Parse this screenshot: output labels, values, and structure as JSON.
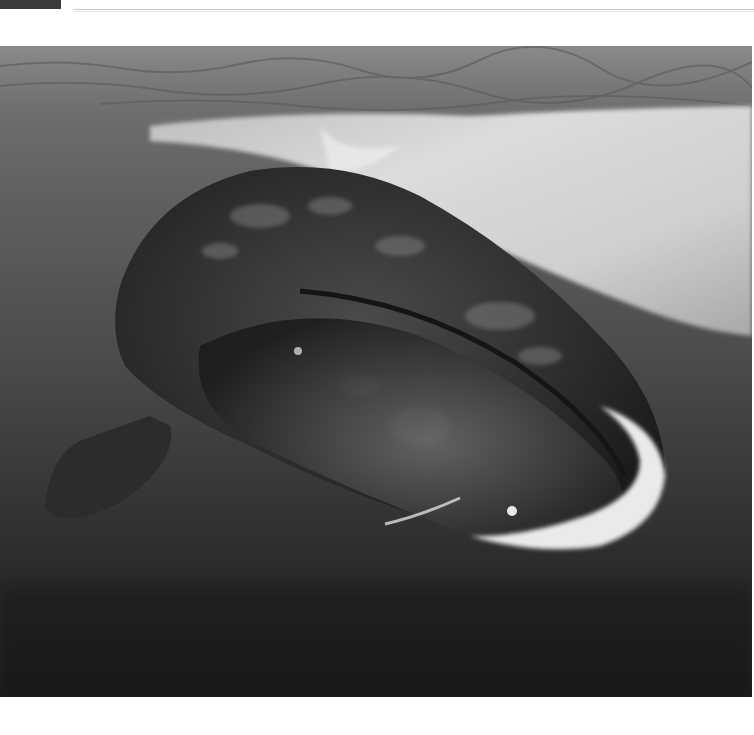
{
  "page": {
    "header": {
      "caption_fragment": "",
      "has_rule": true
    },
    "photo": {
      "subject": "bowhead whale underwater",
      "alt": "Bowhead whale swimming beneath sea ice, black and white photograph",
      "tone": "grayscale",
      "colors": {
        "water_top": "#7a7a7a",
        "water_mid": "#4e4e4e",
        "water_bottom": "#1c1c1c",
        "ice": "#d8d8d8",
        "whale_body": "#2a2a2a",
        "chin_highlight": "#f0f0f0"
      }
    }
  }
}
